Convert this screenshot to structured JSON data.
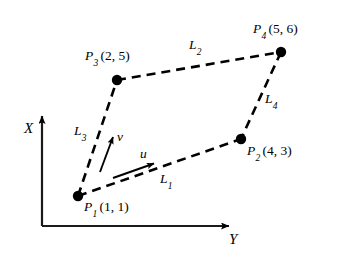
{
  "figure": {
    "background_color": "#ffffff",
    "stroke_color": "#000000",
    "axes": {
      "x_axis": {
        "label": "X",
        "orientation": "vertical",
        "arrow": "up"
      },
      "y_axis": {
        "label": "Y",
        "orientation": "horizontal",
        "arrow": "right"
      },
      "origin_px": [
        42,
        226
      ]
    },
    "points": [
      {
        "id": "P1",
        "name": "P",
        "subscript": "1",
        "coords": "(1, 1)",
        "x": 1,
        "y": 1,
        "px": [
          78,
          196
        ]
      },
      {
        "id": "P2",
        "name": "P",
        "subscript": "2",
        "coords": "(4, 3)",
        "x": 4,
        "y": 3,
        "px": [
          241,
          139
        ]
      },
      {
        "id": "P3",
        "name": "P",
        "subscript": "3",
        "coords": "(2, 5)",
        "x": 2,
        "y": 5,
        "px": [
          117,
          80
        ]
      },
      {
        "id": "P4",
        "name": "P",
        "subscript": "4",
        "coords": "(5, 6)",
        "x": 5,
        "y": 6,
        "px": [
          281,
          52
        ]
      }
    ],
    "edges": [
      {
        "id": "L1",
        "name": "L",
        "subscript": "1",
        "from": "P1",
        "to": "P2",
        "style": "dashed"
      },
      {
        "id": "L2",
        "name": "L",
        "subscript": "2",
        "from": "P3",
        "to": "P4",
        "style": "dashed"
      },
      {
        "id": "L3",
        "name": "L",
        "subscript": "3",
        "from": "P1",
        "to": "P3",
        "style": "dashed"
      },
      {
        "id": "L4",
        "name": "L",
        "subscript": "4",
        "from": "P4",
        "to": "P2",
        "style": "dashed"
      }
    ],
    "vectors": [
      {
        "id": "u",
        "label": "u",
        "style": "solid-arrow",
        "direction": "right-up",
        "from_px": [
          113,
          178
        ],
        "to_px": [
          156,
          163
        ]
      },
      {
        "id": "v",
        "label": "v",
        "style": "solid-arrow",
        "direction": "up-right",
        "from_px": [
          100,
          172
        ],
        "to_px": [
          114,
          134
        ]
      }
    ]
  }
}
